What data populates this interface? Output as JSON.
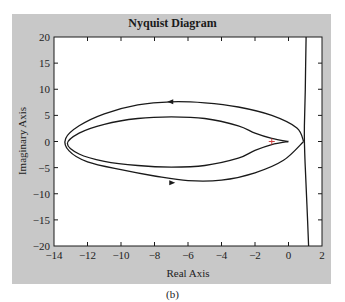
{
  "figure": {
    "caption": "(b)",
    "panel_color": "#c8c8c8",
    "plot_bg": "#ffffff",
    "line_color": "#1a1a1a"
  },
  "chart_data": {
    "type": "line",
    "title": "Nyquist Diagram",
    "xlabel": "Real Axis",
    "ylabel": "Imaginary Axis",
    "xlim": [
      -14,
      2
    ],
    "ylim": [
      -20,
      20
    ],
    "xticks": [
      -14,
      -12,
      -10,
      -8,
      -6,
      -4,
      -2,
      0,
      2
    ],
    "yticks": [
      -20,
      -15,
      -10,
      -5,
      0,
      5,
      10,
      15,
      20
    ],
    "grid": false,
    "legend": null,
    "critical_point": {
      "x": -1,
      "y": 0,
      "marker": "+"
    },
    "series": [
      {
        "name": "outer loop (positive/negative frequency)",
        "points": [
          [
            0.9,
            0
          ],
          [
            0.5,
            2.6
          ],
          [
            -1,
            5.0
          ],
          [
            -3,
            6.6
          ],
          [
            -5,
            7.4
          ],
          [
            -7,
            7.6
          ],
          [
            -9,
            7.0
          ],
          [
            -11,
            5.3
          ],
          [
            -12.5,
            3.0
          ],
          [
            -13.3,
            0.6
          ],
          [
            -13.1,
            -1.8
          ],
          [
            -12,
            -3.9
          ],
          [
            -10,
            -5.4
          ],
          [
            -8,
            -6.6
          ],
          [
            -6,
            -7.5
          ],
          [
            -4,
            -7.4
          ],
          [
            -2,
            -6.0
          ],
          [
            -0.3,
            -3.6
          ],
          [
            0.9,
            0
          ]
        ],
        "arrows": [
          {
            "x": -7,
            "y": 7.6,
            "direction": "left"
          },
          {
            "x": -7,
            "y": -7.9,
            "direction": "right"
          }
        ]
      },
      {
        "name": "inner loop (cusp near origin)",
        "points": [
          [
            0.0,
            0
          ],
          [
            -1,
            0.6
          ],
          [
            -2,
            1.6
          ],
          [
            -3,
            3.0
          ],
          [
            -5,
            4.4
          ],
          [
            -7,
            4.7
          ],
          [
            -9,
            4.4
          ],
          [
            -11,
            3.3
          ],
          [
            -12.5,
            1.6
          ],
          [
            -13.2,
            -0.4
          ],
          [
            -12.5,
            -2.4
          ],
          [
            -11,
            -3.8
          ],
          [
            -9,
            -4.6
          ],
          [
            -7,
            -4.9
          ],
          [
            -5,
            -4.6
          ],
          [
            -3,
            -3.2
          ],
          [
            -2,
            -1.7
          ],
          [
            -1,
            -0.6
          ],
          [
            0.0,
            0
          ]
        ]
      },
      {
        "name": "near-vertical branch",
        "points": [
          [
            1.05,
            20
          ],
          [
            1.0,
            10
          ],
          [
            0.95,
            3
          ],
          [
            0.95,
            0
          ],
          [
            1.0,
            -5
          ],
          [
            1.1,
            -12
          ],
          [
            1.2,
            -20
          ]
        ]
      }
    ]
  }
}
